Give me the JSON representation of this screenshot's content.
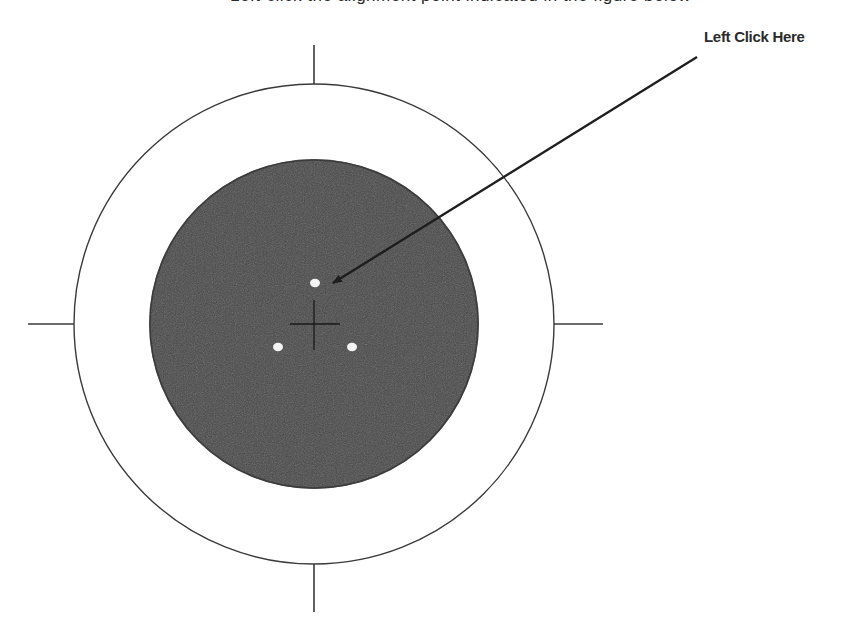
{
  "header": {
    "caption_clipped": "Left-click the alignment point indicated in the figure below"
  },
  "callout": {
    "label": "Left Click Here"
  },
  "target": {
    "center": [
      314,
      324
    ],
    "outer_circle_radius": 240,
    "inner_disc_radius": 165,
    "inner_disc_color": "#4a4a4a",
    "line_color": "#333333",
    "dots": [
      {
        "id": "top",
        "x": 315,
        "y": 283
      },
      {
        "id": "bottom-left",
        "x": 278,
        "y": 347
      },
      {
        "id": "bottom-right",
        "x": 352,
        "y": 347
      }
    ]
  }
}
